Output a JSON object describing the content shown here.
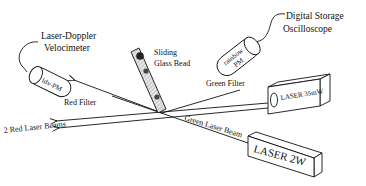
{
  "diagram": {
    "type": "experimental-setup-schematic",
    "labels": {
      "ldv": [
        "Laser-Doppler",
        "Velocimeter"
      ],
      "dso": [
        "Digital Storage",
        "Oscilloscope"
      ],
      "bead": [
        "Sliding",
        "Glass Bead"
      ],
      "ldv_pm": "ldv-PM",
      "rainbow_pm": [
        "rainbow",
        "PM"
      ],
      "red_filter": "Red Filter",
      "green_filter": "Green Filter",
      "red_beams": "2 Red Laser Beams",
      "green_beam": "Green Laser Beam",
      "laser_small": "LASER 35mW",
      "laser_big": "LASER 2W"
    },
    "components": [
      {
        "id": "laser-doppler-velocimeter",
        "connected_to": "ldv-pm"
      },
      {
        "id": "digital-storage-oscilloscope",
        "connected_to": "rainbow-pm"
      },
      {
        "id": "sliding-glass-bead",
        "position": "center"
      },
      {
        "id": "laser-35mw",
        "emits": "2 red laser beams"
      },
      {
        "id": "laser-2w",
        "emits": "green laser beam"
      }
    ],
    "colors": {
      "line": "#111111",
      "background": "#ffffff",
      "tube_hatch": "#bbbbbb"
    }
  }
}
